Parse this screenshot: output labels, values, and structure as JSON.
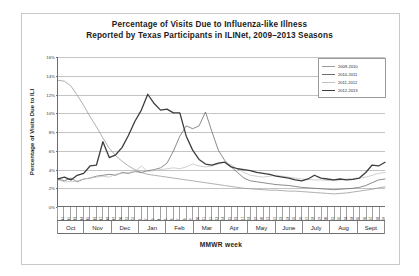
{
  "chart_data": {
    "type": "line",
    "title": "Percentage of Visits Due to Influenza-like Illness",
    "subtitle": "Reported by Texas Participants in ILINet, 2009–2013 Seasons",
    "xlabel": "MMWR week",
    "ylabel": "Percentage of Visits Due to ILI",
    "ylim": [
      0,
      16
    ],
    "ytick_labels": [
      "0%",
      "2%",
      "4%",
      "6%",
      "8%",
      "10%",
      "12%",
      "14%",
      "16%"
    ],
    "ytick_values": [
      0,
      2,
      4,
      6,
      8,
      10,
      12,
      14,
      16
    ],
    "grid": true,
    "legend_position": "top-right",
    "month_labels": [
      "Oct",
      "Nov",
      "Dec",
      "Jan",
      "Feb",
      "Mar",
      "Apr",
      "May",
      "June",
      "July",
      "Aug",
      "Sept"
    ],
    "week_labels": [
      "40",
      "41",
      "42",
      "43",
      "44",
      "45",
      "46",
      "47",
      "48",
      "49",
      "50",
      "51",
      "52",
      "1",
      "2",
      "3",
      "4",
      "5",
      "6",
      "7",
      "8",
      "9",
      "10",
      "11",
      "12",
      "13",
      "14",
      "15",
      "16",
      "17",
      "18",
      "19",
      "20",
      "21",
      "22",
      "23",
      "24",
      "25",
      "26",
      "27",
      "28",
      "29",
      "30",
      "31",
      "32",
      "33",
      "34",
      "35",
      "36",
      "37",
      "38",
      "39"
    ],
    "series": [
      {
        "name": "2009-2010",
        "color": "#9a9a9a",
        "width": 0.8,
        "values": [
          13.5,
          13.4,
          12.9,
          11.9,
          10.8,
          9.6,
          8.5,
          7.3,
          6.2,
          5.4,
          4.8,
          4.3,
          3.9,
          3.6,
          3.4,
          3.3,
          3.2,
          3.1,
          3.0,
          2.9,
          2.8,
          2.7,
          2.6,
          2.5,
          2.4,
          2.3,
          2.2,
          2.1,
          2.0,
          1.9,
          1.85,
          1.8,
          1.75,
          1.7,
          1.7,
          1.65,
          1.6,
          1.6,
          1.55,
          1.5,
          1.45,
          1.4,
          1.35,
          1.3,
          1.35,
          1.4,
          1.5,
          1.6,
          1.7,
          1.8,
          1.95,
          2.05
        ]
      },
      {
        "name": "2010-2011",
        "color": "#6d6d6d",
        "width": 0.8,
        "values": [
          2.9,
          2.7,
          3.0,
          2.6,
          2.9,
          3.0,
          3.2,
          3.3,
          3.4,
          3.3,
          3.6,
          3.5,
          3.7,
          3.6,
          3.8,
          3.9,
          4.1,
          4.6,
          5.9,
          7.5,
          8.6,
          8.3,
          8.6,
          10.1,
          8.0,
          6.0,
          4.9,
          4.2,
          3.6,
          3.0,
          2.7,
          2.6,
          2.5,
          2.4,
          2.3,
          2.25,
          2.2,
          2.1,
          2.0,
          1.95,
          1.9,
          1.85,
          1.8,
          1.75,
          1.8,
          1.85,
          1.9,
          2.0,
          2.2,
          2.5,
          2.8,
          2.9
        ]
      },
      {
        "name": "2011-2012",
        "color": "#c2c2c2",
        "width": 0.8,
        "values": [
          2.8,
          2.6,
          2.6,
          2.7,
          2.9,
          3.0,
          3.1,
          3.2,
          3.1,
          3.4,
          3.5,
          3.6,
          3.7,
          4.3,
          3.7,
          3.8,
          3.9,
          4.0,
          4.1,
          4.0,
          4.2,
          4.5,
          4.3,
          4.2,
          4.3,
          4.5,
          4.7,
          4.4,
          4.0,
          3.6,
          3.3,
          3.2,
          3.1,
          3.2,
          3.3,
          3.2,
          3.1,
          3.0,
          2.9,
          2.85,
          2.8,
          2.8,
          2.75,
          2.7,
          2.8,
          2.9,
          2.95,
          3.0,
          3.1,
          3.3,
          3.5,
          3.6
        ]
      },
      {
        "name": "2012-2013",
        "color": "#3d3d3d",
        "width": 1.3,
        "values": [
          2.9,
          3.1,
          2.8,
          3.3,
          3.5,
          4.3,
          4.4,
          6.9,
          5.2,
          5.5,
          6.3,
          7.6,
          9.1,
          10.3,
          12.0,
          11.0,
          10.3,
          10.4,
          10.0,
          10.0,
          7.5,
          6.0,
          5.0,
          4.5,
          4.4,
          4.6,
          4.7,
          4.2,
          4.0,
          3.9,
          3.8,
          3.6,
          3.5,
          3.4,
          3.2,
          3.1,
          3.0,
          2.8,
          2.7,
          2.9,
          3.3,
          3.0,
          2.9,
          2.8,
          2.9,
          2.8,
          2.85,
          3.0,
          3.6,
          4.4,
          4.3,
          4.7
        ]
      }
    ]
  },
  "legend": {
    "items": [
      {
        "label": "2009-2010",
        "color": "#9a9a9a",
        "width": 0.8
      },
      {
        "label": "2010-2011",
        "color": "#6d6d6d",
        "width": 0.8
      },
      {
        "label": "2011-2012",
        "color": "#c2c2c2",
        "width": 0.8
      },
      {
        "label": "2012-2013",
        "color": "#3d3d3d",
        "width": 1.3
      }
    ]
  }
}
